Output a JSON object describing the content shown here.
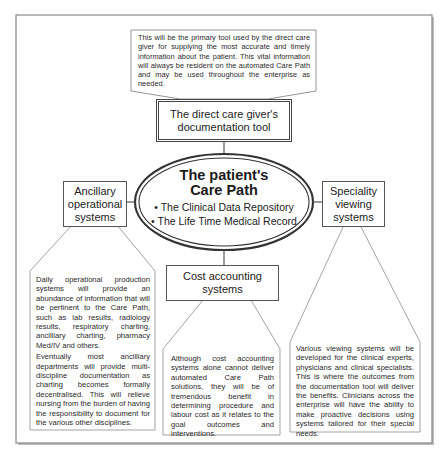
{
  "diagram": {
    "top_note": "This will be the primary tool used by the direct care giver for supplying the most accurate and timely information about the patient. This vital information will always be resident on the automated Care Path and may be used throughout the enterprise as needed.",
    "doc_tool_box": "The direct care giver's documentation tool",
    "center": {
      "title_line1": "The patient's",
      "title_line2": "Care Path",
      "items": [
        "The Clinical Data Repository",
        "The Life Time Medical Record"
      ],
      "bullet": "•"
    },
    "ancillary_box": "Ancillary operational systems",
    "speciality_box": "Speciality viewing systems",
    "cost_box": "Cost accounting systems",
    "ancillary_note": {
      "para1": "Daily operational production systems will provide an abundance of information that will be pertinent to the Care Path, such as lab results, radiology results, respiratory charting, ancilliary charting, pharmacy Med/IV and others.",
      "para2": "Eventually most ancilliary departments will provide multi-discipline documentation as charting becomes formally decentralised. This will relieve nursing from the burden of having the responsibility to document for the various other disciplines."
    },
    "cost_note": "Although cost accounting systems alone cannot deliver automated Care Path solutions, they will be of tremendous benefit in determining procedure and labour cost as it relates to the goal outcomes and interventions.",
    "speciality_note": "Various viewing systems will be developed for the clinical experts, physicians and clinical specialists. This is where the outcomes from the documentation tool will deliver the benefits. Clinicians across the enterprise will have the ability to make proactive decisions using systems tailored for their special needs."
  },
  "colors": {
    "frame": "#888888",
    "line": "#555555",
    "thin_line": "#999999",
    "text": "#222222"
  }
}
